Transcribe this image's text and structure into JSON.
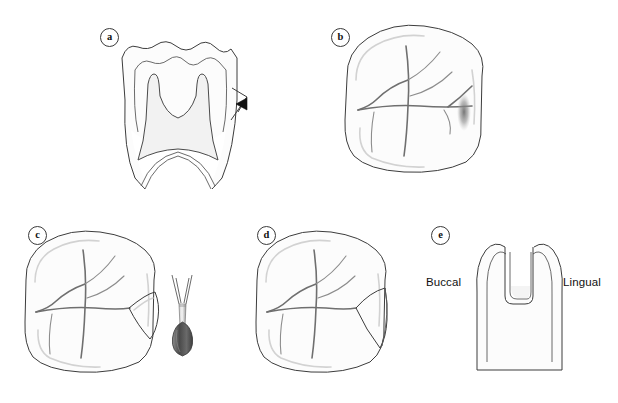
{
  "figure": {
    "background_color": "#ffffff",
    "width": 618,
    "height": 403,
    "panel_count": 5
  },
  "palette": {
    "outline": "#3c3c3c",
    "fissure": "#6f6f6f",
    "contour_shadow": "#d2d2d2",
    "pulp_fill": "#f2f2f2",
    "lesion": "#7b7b7b",
    "bur_head": "#5a5a5a",
    "text": "#111111"
  },
  "panels": [
    {
      "id": "a",
      "label": "a",
      "name": "panel-a-buccolingual-section",
      "view": "bucco-lingual cross-section",
      "description": "Longitudinal section of a molar showing enamel, dentin and pulp chamber with an arrow indicating the lesion site on the lingual enamel wall",
      "label_x": 100,
      "label_y": 28,
      "annotations": [
        {
          "name": "lesion-arrow",
          "kind": "arrowhead",
          "x": 232,
          "y": 104,
          "direction": "left"
        }
      ]
    },
    {
      "id": "b",
      "label": "b",
      "name": "panel-b-occlusal-lesion",
      "view": "occlusal surface",
      "description": "Occlusal view of the molar with fissure pattern and a shadowed carious lesion at the distal marginal ridge",
      "label_x": 331,
      "label_y": 28,
      "annotations": [
        {
          "name": "carious-lesion-shadow",
          "kind": "soft-shadow",
          "x": 462,
          "y": 112
        }
      ]
    },
    {
      "id": "c",
      "label": "c",
      "name": "panel-c-initial-preparation",
      "view": "occlusal surface with bur",
      "description": "Initial small triangular cavity opening cut into the distal fossa, shown beside a round-ended pear bur in a handpiece",
      "label_x": 28,
      "label_y": 226,
      "annotations": [
        {
          "name": "pear-bur",
          "kind": "instrument",
          "x": 178,
          "y": 320
        },
        {
          "name": "initial-cavity-outline",
          "kind": "preparation",
          "x": 148,
          "y": 320
        }
      ]
    },
    {
      "id": "d",
      "label": "d",
      "name": "panel-d-extended-preparation",
      "view": "occlusal surface",
      "description": "Completed rounded cavity preparation extended through the distal marginal ridge",
      "label_x": 257,
      "label_y": 226,
      "annotations": [
        {
          "name": "final-cavity-outline",
          "kind": "preparation",
          "x": 372,
          "y": 320
        }
      ]
    },
    {
      "id": "e",
      "label": "e",
      "name": "panel-e-proximal-section",
      "view": "proximal cross-section",
      "description": "Cross-section through the finished box preparation between the buccal and lingual cusps",
      "label_x": 431,
      "label_y": 226,
      "labels": [
        {
          "name": "buccal-label",
          "text": "Buccal",
          "x": 426,
          "y": 282
        },
        {
          "name": "lingual-label",
          "text": "Lingual",
          "x": 563,
          "y": 282
        }
      ]
    }
  ],
  "text_labels": {
    "buccal": "Buccal",
    "lingual": "Lingual",
    "panel_a": "a",
    "panel_b": "b",
    "panel_c": "c",
    "panel_d": "d",
    "panel_e": "e"
  }
}
